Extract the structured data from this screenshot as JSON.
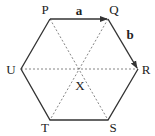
{
  "diagram": {
    "type": "regular-hexagon-vectors",
    "vertices": [
      {
        "label": "P",
        "x": 50,
        "y": 19,
        "label_x": 45,
        "label_y": 14
      },
      {
        "label": "Q",
        "x": 108,
        "y": 19,
        "label_x": 114,
        "label_y": 14
      },
      {
        "label": "R",
        "x": 138,
        "y": 69,
        "label_x": 146,
        "label_y": 74
      },
      {
        "label": "S",
        "x": 108,
        "y": 120,
        "label_x": 113,
        "label_y": 132
      },
      {
        "label": "T",
        "x": 50,
        "y": 120,
        "label_x": 45,
        "label_y": 132
      },
      {
        "label": "U",
        "x": 21,
        "y": 69,
        "label_x": 11,
        "label_y": 74
      }
    ],
    "center": {
      "label": "X",
      "x": 79,
      "y": 69,
      "label_x": 80,
      "label_y": 90
    },
    "vectors": [
      {
        "name": "a",
        "from": "P",
        "to": "Q",
        "label_x": 79,
        "label_y": 15
      },
      {
        "name": "b",
        "from": "Q",
        "to": "R",
        "label_x": 130,
        "label_y": 39
      }
    ],
    "diagonals": [
      "P-S",
      "Q-T",
      "U-R"
    ],
    "colors": {
      "line": "#333333",
      "dashed": "#666666",
      "text": "#222222"
    }
  }
}
